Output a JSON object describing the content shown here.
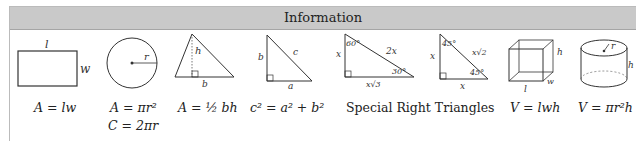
{
  "header": {
    "title": "Information"
  },
  "figures": [
    {
      "name": "rectangle",
      "labels": {
        "top": "l",
        "side": "w"
      },
      "formulas": [
        "A = lw"
      ]
    },
    {
      "name": "circle",
      "labels": {
        "radius": "r"
      },
      "formulas": [
        "A = πr²",
        "C = 2πr"
      ]
    },
    {
      "name": "triangle",
      "labels": {
        "height": "h",
        "base": "b"
      },
      "formulas": [
        "A = ½ bh"
      ]
    },
    {
      "name": "right-triangle",
      "labels": {
        "leg_vertical": "b",
        "hypotenuse": "c",
        "leg_horizontal": "a"
      },
      "formulas": [
        "c² = a² + b²"
      ]
    },
    {
      "name": "special-30-60-90",
      "labels": {
        "angle_top": "60°",
        "angle_bottom": "30°",
        "short_leg": "x",
        "hypotenuse": "2x",
        "long_leg": "x√3"
      }
    },
    {
      "name": "special-45-45-90",
      "labels": {
        "angle_top": "45°",
        "angle_bottom": "45°",
        "leg_vertical": "x",
        "hypotenuse": "x√2",
        "leg_horizontal": "x"
      }
    },
    {
      "name": "box",
      "labels": {
        "height": "h",
        "width": "w",
        "length": "l"
      },
      "formulas": [
        "V = lwh"
      ]
    },
    {
      "name": "cylinder",
      "labels": {
        "radius": "r",
        "height": "h"
      },
      "formulas": [
        "V = πr²h"
      ]
    }
  ],
  "special_caption": "Special Right Triangles"
}
